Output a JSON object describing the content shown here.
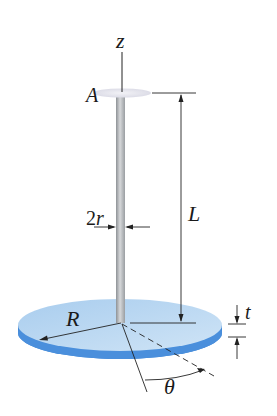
{
  "labels": {
    "z_axis": "z",
    "point_A": "A",
    "diameter": "2r",
    "length": "L",
    "thickness": "t",
    "radius": "R",
    "angle": "θ"
  },
  "colors": {
    "disk_top": "#bcd9f2",
    "disk_edge": "#3f86d6",
    "rod": "#b9bcc0",
    "dim_line": "#222222"
  }
}
